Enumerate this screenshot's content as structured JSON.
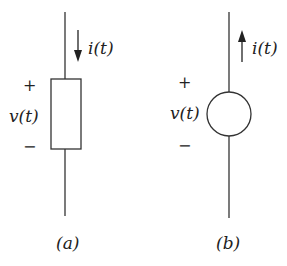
{
  "diagram_a": {
    "label": "(a)",
    "element": "rectangle",
    "current_label": "i(t)",
    "current_direction": "down",
    "voltage_label": "v(t)",
    "plus": "+",
    "minus": "−"
  },
  "diagram_b": {
    "label": "(b)",
    "element": "circle",
    "current_label": "i(t)",
    "current_direction": "up",
    "voltage_label": "v(t)",
    "plus": "+",
    "minus": "−"
  },
  "colors": {
    "stroke": "#333333",
    "background": "#ffffff"
  }
}
